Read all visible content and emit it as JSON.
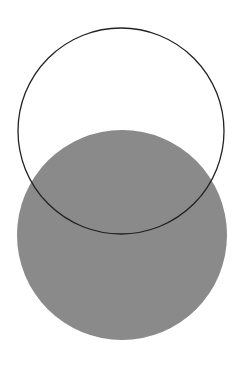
{
  "diagram": {
    "type": "two-circles",
    "background": "#ffffff",
    "shapes": [
      {
        "name": "gray-filled-circle",
        "cx": 122,
        "cy": 235,
        "r": 105,
        "fill": "#8a8a8a",
        "stroke": "none"
      },
      {
        "name": "outline-circle",
        "cx": 121,
        "cy": 131,
        "r": 103,
        "fill": "none",
        "stroke": "#222222",
        "stroke_width": 1.3
      }
    ]
  }
}
